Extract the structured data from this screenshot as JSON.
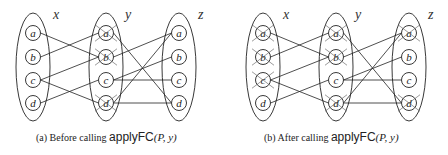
{
  "panels": [
    {
      "id": "a",
      "offset_x": 0,
      "caption": {
        "prefix": "(a)  Before calling ",
        "function": "applyFC",
        "args": "(P, y)"
      },
      "groups": [
        {
          "label": "x",
          "cx": 33,
          "label_x": 53,
          "nodes": [
            "a",
            "b",
            "c",
            "d"
          ],
          "crossed": []
        },
        {
          "label": "y",
          "cx": 106,
          "label_x": 125,
          "nodes": [
            "a",
            "b",
            "c",
            "d"
          ],
          "crossed": [
            "a",
            "b",
            "d"
          ]
        },
        {
          "label": "z",
          "cx": 179,
          "label_x": 198,
          "nodes": [
            "a",
            "b",
            "c",
            "d"
          ],
          "crossed": []
        }
      ],
      "edges_xy": [
        [
          "a",
          "b"
        ],
        [
          "b",
          "a"
        ],
        [
          "c",
          "b"
        ],
        [
          "c",
          "d"
        ],
        [
          "d",
          "c"
        ]
      ],
      "edges_yz": [
        [
          "a",
          "d"
        ],
        [
          "b",
          "a"
        ],
        [
          "c",
          "b"
        ],
        [
          "c",
          "c"
        ],
        [
          "d",
          "a"
        ],
        [
          "d",
          "d"
        ]
      ]
    },
    {
      "id": "b",
      "offset_x": 0,
      "caption": {
        "prefix": "(b)  After calling ",
        "function": "applyFC",
        "args": "(P, y)"
      },
      "groups": [
        {
          "label": "x",
          "cx": 263,
          "label_x": 283,
          "nodes": [
            "a",
            "b",
            "c",
            "d"
          ],
          "crossed": [
            "a",
            "b",
            "c"
          ]
        },
        {
          "label": "y",
          "cx": 336,
          "label_x": 355,
          "nodes": [
            "a",
            "b",
            "c",
            "d"
          ],
          "crossed": [
            "a",
            "b",
            "d"
          ]
        },
        {
          "label": "z",
          "cx": 409,
          "label_x": 428,
          "nodes": [
            "a",
            "b",
            "c",
            "d"
          ],
          "crossed": [
            "a",
            "d"
          ]
        }
      ],
      "edges_xy": [
        [
          "a",
          "b"
        ],
        [
          "b",
          "a"
        ],
        [
          "c",
          "b"
        ],
        [
          "c",
          "d"
        ],
        [
          "d",
          "c"
        ]
      ],
      "edges_yz": [
        [
          "a",
          "d"
        ],
        [
          "b",
          "a"
        ],
        [
          "c",
          "b"
        ],
        [
          "c",
          "c"
        ],
        [
          "d",
          "a"
        ],
        [
          "d",
          "d"
        ]
      ]
    }
  ],
  "layout": {
    "node_y": [
      33,
      57,
      80,
      103
    ],
    "node_r": 7.5,
    "ellipse_rx": 17,
    "ellipse_ry": 54,
    "ellipse_cy": 67,
    "label_y": 19,
    "stroke": "#222222"
  }
}
